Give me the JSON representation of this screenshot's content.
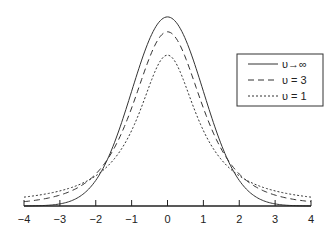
{
  "chart_data": {
    "type": "line",
    "title": "",
    "xlabel": "",
    "ylabel": "",
    "xlim": [
      -4,
      4
    ],
    "ylim": [
      0,
      0.4
    ],
    "grid": false,
    "legend_position": "upper right",
    "x_ticks": [
      -4,
      -3,
      -2,
      -1,
      0,
      1,
      2,
      3,
      4
    ],
    "x_tick_labels": [
      "−4",
      "−3",
      "−2",
      "−1",
      "0",
      "1",
      "2",
      "3",
      "4"
    ],
    "x": [
      -4,
      -3,
      -2,
      -1,
      0,
      1,
      2,
      3,
      4
    ],
    "series": [
      {
        "name": "υ→∞",
        "style": "solid",
        "description": "Standard normal density",
        "values": [
          0.0001,
          0.0044,
          0.054,
          0.242,
          0.399,
          0.242,
          0.054,
          0.0044,
          0.0001
        ]
      },
      {
        "name": "υ = 3",
        "style": "dashed",
        "description": "Student t density, 3 degrees of freedom",
        "values": [
          0.0092,
          0.023,
          0.0675,
          0.2067,
          0.3676,
          0.2067,
          0.0675,
          0.023,
          0.0092
        ]
      },
      {
        "name": "υ = 1",
        "style": "dotted",
        "description": "Student t density, 1 degree of freedom (Cauchy)",
        "values": [
          0.0187,
          0.0318,
          0.0637,
          0.1592,
          0.3183,
          0.1592,
          0.0637,
          0.0318,
          0.0187
        ]
      }
    ]
  },
  "legend": {
    "items": [
      {
        "label": "υ→∞"
      },
      {
        "label": "υ = 3"
      },
      {
        "label": "υ = 1"
      }
    ]
  }
}
